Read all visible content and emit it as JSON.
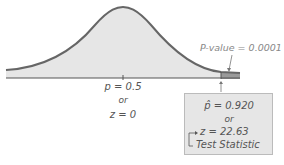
{
  "diagram": {
    "type": "normal-distribution-hypothesis-test",
    "center_label": {
      "line1": "p = 0.5",
      "line2": "or",
      "line3": "z = 0"
    },
    "pvalue_label": "P-value = 0.0001",
    "test_box": {
      "line1": "p̂ = 0.920",
      "line2": "or",
      "line3": "z = 22.63",
      "line4": "Test Statistic"
    },
    "colors": {
      "curve": "#666666",
      "fill": "#e6e6e6",
      "tail_fill": "#999999",
      "axis": "#555555"
    }
  }
}
